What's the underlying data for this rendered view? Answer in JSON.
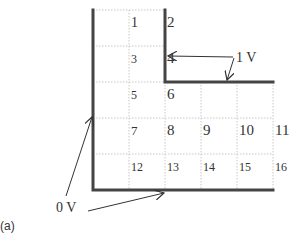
{
  "figure": {
    "caption": "(a)",
    "grid": {
      "origin_x": 93,
      "origin_y": 10,
      "cell_size": 36,
      "columns": 5,
      "rows": 5,
      "grid_color": "#c8c8c8",
      "boundary_color": "#444444"
    },
    "cells": [
      {
        "n": "1",
        "col": 1,
        "row": 0,
        "size": 14
      },
      {
        "n": "2",
        "col": 2,
        "row": 0,
        "size": 15
      },
      {
        "n": "3",
        "col": 1,
        "row": 1,
        "size": 12
      },
      {
        "n": "4",
        "col": 2,
        "row": 1,
        "size": 15
      },
      {
        "n": "5",
        "col": 1,
        "row": 2,
        "size": 12
      },
      {
        "n": "6",
        "col": 2,
        "row": 2,
        "size": 15
      },
      {
        "n": "7",
        "col": 1,
        "row": 3,
        "size": 13
      },
      {
        "n": "8",
        "col": 2,
        "row": 3,
        "size": 15
      },
      {
        "n": "9",
        "col": 3,
        "row": 3,
        "size": 15
      },
      {
        "n": "10",
        "col": 4,
        "row": 3,
        "size": 15
      },
      {
        "n": "11",
        "col": 5,
        "row": 3,
        "size": 15
      },
      {
        "n": "12",
        "col": 1,
        "row": 4,
        "size": 12
      },
      {
        "n": "13",
        "col": 2,
        "row": 4,
        "size": 12
      },
      {
        "n": "14",
        "col": 3,
        "row": 4,
        "size": 12
      },
      {
        "n": "15",
        "col": 4,
        "row": 4,
        "size": 12
      },
      {
        "n": "16",
        "col": 5,
        "row": 4,
        "size": 12
      }
    ],
    "labels": {
      "one_volt": "1 V",
      "zero_volt": "0 V"
    }
  }
}
